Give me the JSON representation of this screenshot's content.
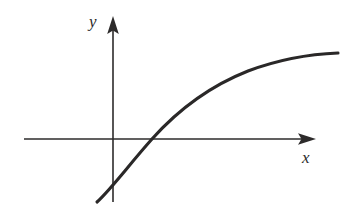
{
  "figure": {
    "kind": "line-plot",
    "background_color": "#ffffff",
    "ink_color": "#2d2b2b",
    "width": 346,
    "height": 224,
    "axes": {
      "origin": {
        "x": 113,
        "y": 139
      },
      "x_axis": {
        "label": "x",
        "label_style": "italic-serif",
        "start_x": 24,
        "end_x": 316,
        "y": 139,
        "arrow": "right",
        "has_ticks": false,
        "has_tick_labels": false
      },
      "y_axis": {
        "label": "y",
        "label_style": "italic-serif",
        "x": 113,
        "start_y": 202,
        "end_y": 16,
        "arrow": "up",
        "has_ticks": false,
        "has_tick_labels": false
      }
    },
    "curve": {
      "name": "increasing-concave-down-curve",
      "description": "monotonically increasing, concave down, logarithmic-like",
      "stroke_color": "#2a2828",
      "stroke_width": 3.1,
      "start_point": {
        "x": 97,
        "y": 202
      },
      "end_point": {
        "x": 338,
        "y": 53
      },
      "y_intercept": {
        "x": 113,
        "y": 185
      },
      "x_intercept": {
        "x": 152,
        "y": 139
      },
      "path": "M 97 202 C 112 188 128 166 152 139 C 178 110 210 86 248 71 C 280 59 312 54 338 53"
    }
  },
  "chart_data": {
    "type": "line",
    "title": "",
    "subtitle": "",
    "xlabel": "x",
    "ylabel": "y",
    "grid": false,
    "legend": false,
    "legend_position": "none",
    "axis_arrows": {
      "x": "right",
      "y": "up"
    },
    "tick_labels": {
      "x": [],
      "y": []
    },
    "xlim": [
      -1.1,
      8.0
    ],
    "ylim": [
      -2.2,
      3.6
    ],
    "series": [
      {
        "name": "increasing-concave-down-curve",
        "color": "#2a2828",
        "x": [
          -0.55,
          -0.35,
          -0.1,
          0.0,
          0.35,
          0.75,
          1.35,
          2.0,
          2.8,
          3.6,
          4.5,
          5.4,
          6.3,
          7.2,
          7.8
        ],
        "y": [
          -2.1,
          -1.82,
          -1.4,
          -1.22,
          -0.62,
          0.0,
          0.72,
          1.28,
          1.78,
          2.12,
          2.42,
          2.63,
          2.78,
          2.88,
          2.92
        ]
      }
    ],
    "annotations": [
      {
        "text": "y",
        "x_px": 96,
        "y_px": 22,
        "style": "italic-serif"
      },
      {
        "text": "x",
        "x_px": 309,
        "y_px": 158,
        "style": "italic-serif"
      }
    ]
  }
}
